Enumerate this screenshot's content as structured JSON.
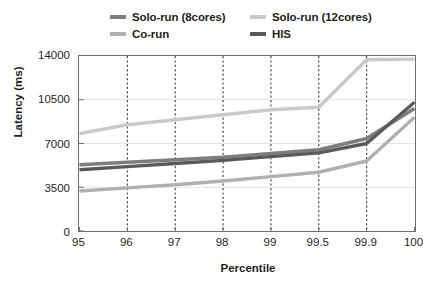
{
  "chart_data": {
    "type": "line",
    "title": "",
    "xlabel": "Percentile",
    "ylabel": "Latency (ms)",
    "categories": [
      "95",
      "96",
      "97",
      "98",
      "99",
      "99.5",
      "99.9",
      "100"
    ],
    "x_tick_labels": [
      "95",
      "96",
      "97",
      "98",
      "99",
      "99.5",
      "99.9",
      "100"
    ],
    "y_tick_labels": [
      "0",
      "3500",
      "7000",
      "10500",
      "14000"
    ],
    "y_ticks": [
      0,
      3500,
      7000,
      10500,
      14000
    ],
    "ylim": [
      0,
      14000
    ],
    "grid": "vertical dotted gridlines at each category, faint horizontal gridlines at y ticks",
    "legend_position": "above plot, two columns",
    "series": [
      {
        "name": "Solo-run (8cores)",
        "color": "#7d7d7d",
        "values": [
          5300,
          5500,
          5700,
          5900,
          6200,
          6500,
          7400,
          9800
        ]
      },
      {
        "name": "Solo-run (12cores)",
        "color": "#c9c9c9",
        "values": [
          7800,
          8500,
          8900,
          9300,
          9700,
          9900,
          13700,
          13750
        ]
      },
      {
        "name": "Co-run",
        "color": "#b0b0b0",
        "values": [
          3200,
          3450,
          3700,
          4000,
          4350,
          4700,
          5600,
          9100
        ]
      },
      {
        "name": "HIS",
        "color": "#5a5a5a",
        "values": [
          4900,
          5150,
          5400,
          5650,
          5950,
          6250,
          7000,
          10300
        ]
      }
    ]
  },
  "legend": {
    "items": [
      {
        "label": "Solo-run (8cores)",
        "color": "#7d7d7d"
      },
      {
        "label": "Solo-run (12cores)",
        "color": "#c9c9c9"
      },
      {
        "label": "Co-run",
        "color": "#b0b0b0"
      },
      {
        "label": "HIS",
        "color": "#5a5a5a"
      }
    ]
  },
  "axes": {
    "y_title": "Latency (ms)",
    "x_title": "Percentile",
    "frame_color": "#6e6e6e",
    "gridline_color": "#3f3f3f"
  }
}
